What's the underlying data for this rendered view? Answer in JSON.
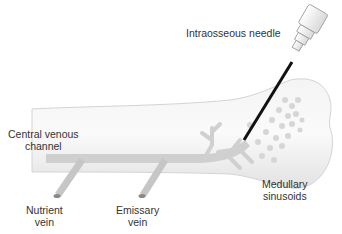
{
  "diagram": {
    "labels": {
      "needle": "Intraosseous needle",
      "central_channel_line1": "Central venous",
      "central_channel_line2": "channel",
      "nutrient_line1": "Nutrient",
      "nutrient_line2": "vein",
      "emissary_line1": "Emissary",
      "emissary_line2": "vein",
      "sinusoids_line1": "Medullary",
      "sinusoids_line2": "sinusoids"
    },
    "colors": {
      "bone_fill": "#ececec",
      "bone_edge": "#cfcfcf",
      "vein": "#c8c8c8",
      "needle": "#111111",
      "hub": "#f2f2f2",
      "text": "#333333"
    }
  }
}
